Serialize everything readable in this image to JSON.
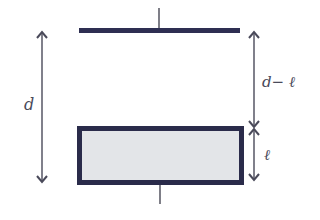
{
  "diagram": {
    "colors": {
      "plate": "#2e2f52",
      "slab_fill": "#e3e5e8",
      "slab_border": "#2a2b4a",
      "wire": "#3a3a48",
      "arrow": "#4a4a5a",
      "background": "#ffffff"
    },
    "labels": {
      "total_gap": "d",
      "gap_above_slab": "d− ℓ",
      "slab_thickness": "ℓ"
    },
    "elements": [
      {
        "name": "top-plate",
        "type": "plate"
      },
      {
        "name": "slab",
        "type": "rectangle"
      },
      {
        "name": "top-wire",
        "type": "lead"
      },
      {
        "name": "bottom-wire",
        "type": "lead"
      },
      {
        "name": "d-dimension-arrow",
        "type": "double-arrow"
      },
      {
        "name": "d-minus-l-dimension-arrow",
        "type": "double-arrow"
      },
      {
        "name": "l-dimension-arrow",
        "type": "double-arrow"
      }
    ]
  }
}
